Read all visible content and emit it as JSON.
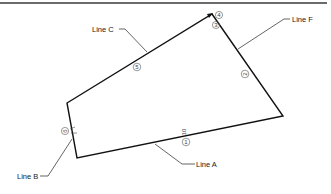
{
  "diagram": {
    "border": {
      "color": "#3a3a3a"
    },
    "shape": {
      "stroke": "#111111",
      "vertices": [
        [
          212,
          14
        ],
        [
          283,
          116
        ],
        [
          77,
          158
        ],
        [
          67,
          103
        ]
      ]
    },
    "line_labels": [
      {
        "id": "line-c",
        "text": "Line C"
      },
      {
        "id": "line-f",
        "text": "Line F"
      },
      {
        "id": "line-a",
        "text": "Line A"
      },
      {
        "id": "line-b",
        "text": "Line B"
      }
    ],
    "markers": [
      {
        "id": "marker-4",
        "text": "4"
      },
      {
        "id": "marker-3",
        "text": "3"
      },
      {
        "id": "marker-5",
        "text": "5"
      },
      {
        "id": "marker-2",
        "text": "2"
      },
      {
        "id": "marker-1",
        "text": "1"
      },
      {
        "id": "marker-6",
        "text": "6"
      }
    ],
    "annotations": [
      {
        "id": "dimension-10",
        "text": "10"
      }
    ]
  }
}
